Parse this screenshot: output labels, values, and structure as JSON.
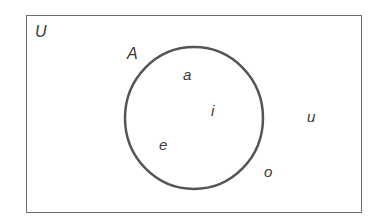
{
  "diagram": {
    "type": "venn",
    "universe_label": "U",
    "set_label": "A",
    "inside_elements": [
      "a",
      "i",
      "e"
    ],
    "outside_elements": [
      "u",
      "o"
    ],
    "colors": {
      "stroke": "#555555",
      "text": "#3a3a3a",
      "background": "#ffffff"
    }
  }
}
